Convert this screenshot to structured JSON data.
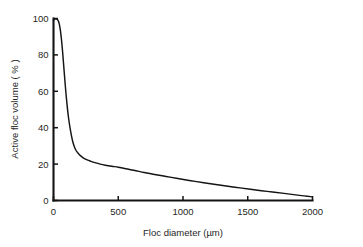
{
  "chart_data": {
    "type": "line",
    "title": "",
    "subtitle": "",
    "xlabel": "Floc diameter (µm)",
    "ylabel": "Active floc volume ( % )",
    "xlim": [
      0,
      2000
    ],
    "ylim": [
      0,
      100
    ],
    "xticks": [
      0,
      500,
      1000,
      1500,
      2000
    ],
    "yticks": [
      0,
      20,
      40,
      60,
      80,
      100
    ],
    "xtick_labels": [
      "0",
      "500",
      "1000",
      "1500",
      "2000"
    ],
    "ytick_labels": [
      "0",
      "20",
      "40",
      "60",
      "80",
      "100"
    ],
    "grid": false,
    "legend": false,
    "legend_position": "none",
    "annotations": [],
    "series": [
      {
        "name": "Active floc volume",
        "color": "#141414",
        "x": [
          0,
          10,
          20,
          30,
          40,
          50,
          60,
          70,
          80,
          90,
          100,
          115,
          130,
          150,
          170,
          190,
          210,
          235,
          260,
          290,
          320,
          360,
          400,
          450,
          500,
          560,
          620,
          700,
          780,
          870,
          960,
          1060,
          1160,
          1280,
          1400,
          1520,
          1650,
          1780,
          1900,
          2000
        ],
        "y": [
          99.0,
          99.6,
          99.8,
          99.5,
          98.2,
          95.0,
          89.5,
          82.0,
          73.0,
          64.0,
          56.0,
          46.0,
          39.0,
          32.0,
          28.0,
          26.0,
          24.5,
          23.2,
          22.3,
          21.5,
          20.8,
          20.0,
          19.4,
          18.8,
          18.3,
          17.4,
          16.6,
          15.4,
          14.3,
          13.2,
          12.1,
          10.9,
          9.8,
          8.5,
          7.3,
          6.2,
          5.0,
          3.9,
          2.8,
          2.0
        ]
      }
    ],
    "notable_points": [
      {
        "x": 0,
        "y": 99.0,
        "note": "start, near maximum"
      },
      {
        "x": 20,
        "y": 99.8,
        "note": "peak plateau"
      },
      {
        "x": 150,
        "y": 32.0,
        "note": "steep descent"
      },
      {
        "x": 260,
        "y": 22.3,
        "note": "knee of curve"
      },
      {
        "x": 500,
        "y": 18.3,
        "note": "tail"
      },
      {
        "x": 1000,
        "y": 11.6,
        "note": "tail"
      },
      {
        "x": 1500,
        "y": 6.4,
        "note": "tail"
      },
      {
        "x": 2000,
        "y": 2.0,
        "note": "end"
      }
    ]
  },
  "figure": {
    "background_color": "#ffffff",
    "line_color": "#141414",
    "axis_color": "#141414"
  }
}
